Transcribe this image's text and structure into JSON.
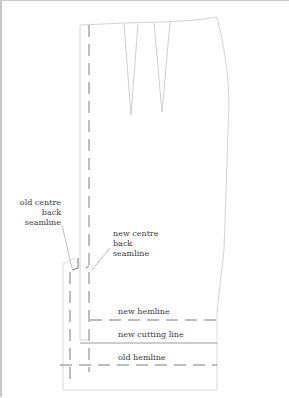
{
  "labels": {
    "old_centre_back": [
      "old centre",
      "back",
      "seamline"
    ],
    "new_centre_back": [
      "new centre",
      "back",
      "seamline"
    ],
    "new_hemline": "new hemline",
    "new_cutting_line": "new cutting line",
    "old_hemline": "old hemline"
  },
  "colors": {
    "outline": "#d4d4d4",
    "dashed": "#7a7a7a",
    "cutting_line": "#9a9a9a",
    "text": "#3a3a3a"
  }
}
